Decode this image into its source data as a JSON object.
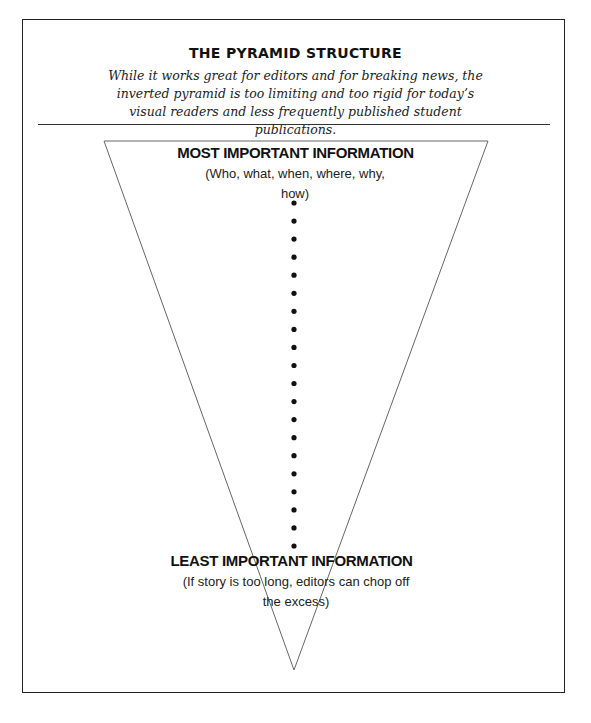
{
  "header": {
    "title": "THE PYRAMID STRUCTURE",
    "subtitle": "While it works great for editors and for breaking news, the inverted pyramid is too limiting and too rigid for today’s visual readers and less frequently published student publications."
  },
  "diagram": {
    "shape": "inverted-triangle",
    "top": {
      "label": "MOST IMPORTANT INFORMATION",
      "detail": "(Who, what, when, where, why, how)"
    },
    "bottom": {
      "label": "LEAST IMPORTANT INFORMATION",
      "detail": "(If story is too long, editors can chop off the excess)"
    },
    "dotted_line": {
      "dot_count": 20,
      "color": "#111111"
    },
    "line_color": "#666666"
  }
}
